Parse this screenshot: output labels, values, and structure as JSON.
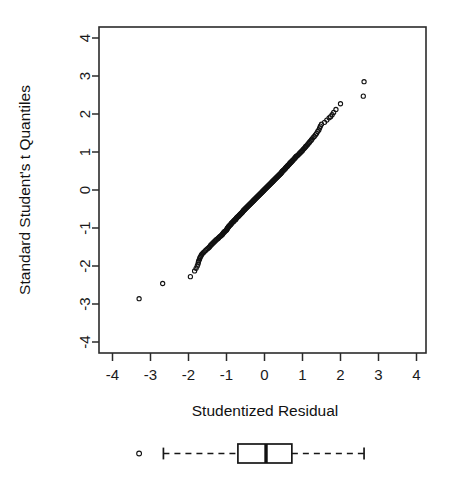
{
  "figure": {
    "background": "#ffffff",
    "foreground": "#1a1a1a"
  },
  "labels": {
    "y_axis_title": "Standard Student's t Quantiles",
    "x_axis_title": "Studentized Residual"
  },
  "chart_data": {
    "type": "scatter",
    "title": "",
    "subtitle": "",
    "xlabel": "Studentized Residual",
    "ylabel": "Standard Student's t Quantiles",
    "xlim": [
      -4.3,
      4.3
    ],
    "ylim": [
      -4.3,
      4.3
    ],
    "xticks": [
      "-4",
      "-3",
      "-2",
      "-1",
      "0",
      "1",
      "2",
      "3",
      "4"
    ],
    "xtick_values": [
      -4,
      -3,
      -2,
      -1,
      0,
      1,
      2,
      3,
      4
    ],
    "yticks": [
      "-4",
      "-3",
      "-2",
      "-1",
      "0",
      "1",
      "2",
      "3",
      "4"
    ],
    "ytick_values": [
      -4,
      -3,
      -2,
      -1,
      0,
      1,
      2,
      3,
      4
    ],
    "grid": false,
    "legend": "none",
    "marker": "open-circle",
    "marker_color": "#121212",
    "marker_radius": 2.1,
    "points": [
      [
        -3.3,
        -2.86
      ],
      [
        -2.68,
        -2.46
      ],
      [
        -1.95,
        -2.28
      ],
      [
        -1.84,
        -2.13
      ],
      [
        -1.8,
        -2.06
      ],
      [
        -1.77,
        -2.0
      ],
      [
        -1.75,
        -1.95
      ],
      [
        -1.74,
        -1.9
      ],
      [
        -1.73,
        -1.86
      ],
      [
        -1.71,
        -1.82
      ],
      [
        -1.7,
        -1.78
      ],
      [
        -1.68,
        -1.75
      ],
      [
        -1.66,
        -1.71
      ],
      [
        -1.64,
        -1.68
      ],
      [
        -1.61,
        -1.65
      ],
      [
        -1.58,
        -1.62
      ],
      [
        -1.55,
        -1.59
      ],
      [
        -1.52,
        -1.56
      ],
      [
        -1.49,
        -1.54
      ],
      [
        -1.46,
        -1.51
      ],
      [
        -1.44,
        -1.49
      ],
      [
        -1.42,
        -1.46
      ],
      [
        -1.4,
        -1.44
      ],
      [
        -1.38,
        -1.42
      ],
      [
        -1.36,
        -1.4
      ],
      [
        -1.34,
        -1.38
      ],
      [
        -1.32,
        -1.36
      ],
      [
        -1.3,
        -1.34
      ],
      [
        -1.28,
        -1.32
      ],
      [
        -1.26,
        -1.3
      ],
      [
        -1.23,
        -1.28
      ],
      [
        -1.21,
        -1.26
      ],
      [
        -1.19,
        -1.24
      ],
      [
        -1.17,
        -1.22
      ],
      [
        -1.15,
        -1.21
      ],
      [
        -1.13,
        -1.19
      ],
      [
        -1.11,
        -1.17
      ],
      [
        -1.1,
        -1.16
      ],
      [
        -1.09,
        -1.14
      ],
      [
        -1.08,
        -1.12
      ],
      [
        -1.06,
        -1.11
      ],
      [
        -1.05,
        -1.09
      ],
      [
        -1.03,
        -1.08
      ],
      [
        -1.01,
        -1.06
      ],
      [
        -1.0,
        -1.05
      ],
      [
        -0.99,
        -1.03
      ],
      [
        -0.98,
        -1.02
      ],
      [
        -0.97,
        -1.0
      ],
      [
        -0.96,
        -0.99
      ],
      [
        -0.95,
        -0.97
      ],
      [
        -0.94,
        -0.96
      ],
      [
        -0.93,
        -0.95
      ],
      [
        -0.92,
        -0.93
      ],
      [
        -0.9,
        -0.92
      ],
      [
        -0.89,
        -0.91
      ],
      [
        -0.88,
        -0.89
      ],
      [
        -0.87,
        -0.88
      ],
      [
        -0.86,
        -0.87
      ],
      [
        -0.85,
        -0.85
      ],
      [
        -0.83,
        -0.84
      ],
      [
        -0.82,
        -0.83
      ],
      [
        -0.81,
        -0.82
      ],
      [
        -0.8,
        -0.8
      ],
      [
        -0.78,
        -0.79
      ],
      [
        -0.77,
        -0.78
      ],
      [
        -0.76,
        -0.77
      ],
      [
        -0.75,
        -0.76
      ],
      [
        -0.74,
        -0.74
      ],
      [
        -0.73,
        -0.73
      ],
      [
        -0.72,
        -0.72
      ],
      [
        -0.71,
        -0.71
      ],
      [
        -0.7,
        -0.7
      ],
      [
        -0.68,
        -0.69
      ],
      [
        -0.67,
        -0.67
      ],
      [
        -0.66,
        -0.66
      ],
      [
        -0.65,
        -0.65
      ],
      [
        -0.64,
        -0.64
      ],
      [
        -0.63,
        -0.63
      ],
      [
        -0.62,
        -0.62
      ],
      [
        -0.61,
        -0.61
      ],
      [
        -0.6,
        -0.6
      ],
      [
        -0.59,
        -0.59
      ],
      [
        -0.58,
        -0.58
      ],
      [
        -0.57,
        -0.56
      ],
      [
        -0.56,
        -0.55
      ],
      [
        -0.55,
        -0.54
      ],
      [
        -0.54,
        -0.53
      ],
      [
        -0.53,
        -0.52
      ],
      [
        -0.52,
        -0.51
      ],
      [
        -0.51,
        -0.5
      ],
      [
        -0.5,
        -0.49
      ],
      [
        -0.49,
        -0.48
      ],
      [
        -0.48,
        -0.47
      ],
      [
        -0.47,
        -0.46
      ],
      [
        -0.46,
        -0.45
      ],
      [
        -0.45,
        -0.44
      ],
      [
        -0.44,
        -0.43
      ],
      [
        -0.43,
        -0.42
      ],
      [
        -0.42,
        -0.41
      ],
      [
        -0.41,
        -0.4
      ],
      [
        -0.4,
        -0.39
      ],
      [
        -0.39,
        -0.38
      ],
      [
        -0.38,
        -0.37
      ],
      [
        -0.37,
        -0.36
      ],
      [
        -0.36,
        -0.35
      ],
      [
        -0.35,
        -0.34
      ],
      [
        -0.34,
        -0.33
      ],
      [
        -0.33,
        -0.32
      ],
      [
        -0.32,
        -0.31
      ],
      [
        -0.31,
        -0.3
      ],
      [
        -0.3,
        -0.29
      ],
      [
        -0.29,
        -0.28
      ],
      [
        -0.28,
        -0.27
      ],
      [
        -0.27,
        -0.26
      ],
      [
        -0.26,
        -0.25
      ],
      [
        -0.25,
        -0.24
      ],
      [
        -0.24,
        -0.23
      ],
      [
        -0.23,
        -0.22
      ],
      [
        -0.22,
        -0.21
      ],
      [
        -0.21,
        -0.2
      ],
      [
        -0.2,
        -0.19
      ],
      [
        -0.19,
        -0.18
      ],
      [
        -0.18,
        -0.17
      ],
      [
        -0.17,
        -0.16
      ],
      [
        -0.16,
        -0.15
      ],
      [
        -0.15,
        -0.14
      ],
      [
        -0.14,
        -0.13
      ],
      [
        -0.13,
        -0.12
      ],
      [
        -0.12,
        -0.11
      ],
      [
        -0.11,
        -0.1
      ],
      [
        -0.1,
        -0.09
      ],
      [
        -0.09,
        -0.08
      ],
      [
        -0.08,
        -0.07
      ],
      [
        -0.07,
        -0.06
      ],
      [
        -0.06,
        -0.05
      ],
      [
        -0.05,
        -0.04
      ],
      [
        -0.04,
        -0.03
      ],
      [
        -0.03,
        -0.02
      ],
      [
        -0.02,
        -0.01
      ],
      [
        -0.01,
        0.0
      ],
      [
        0.0,
        0.01
      ],
      [
        0.01,
        0.02
      ],
      [
        0.02,
        0.03
      ],
      [
        0.03,
        0.04
      ],
      [
        0.04,
        0.05
      ],
      [
        0.05,
        0.06
      ],
      [
        0.06,
        0.07
      ],
      [
        0.07,
        0.08
      ],
      [
        0.08,
        0.09
      ],
      [
        0.09,
        0.1
      ],
      [
        0.1,
        0.11
      ],
      [
        0.11,
        0.12
      ],
      [
        0.12,
        0.13
      ],
      [
        0.13,
        0.14
      ],
      [
        0.14,
        0.15
      ],
      [
        0.15,
        0.16
      ],
      [
        0.16,
        0.17
      ],
      [
        0.17,
        0.18
      ],
      [
        0.18,
        0.19
      ],
      [
        0.19,
        0.2
      ],
      [
        0.2,
        0.21
      ],
      [
        0.21,
        0.22
      ],
      [
        0.22,
        0.23
      ],
      [
        0.23,
        0.24
      ],
      [
        0.24,
        0.25
      ],
      [
        0.25,
        0.26
      ],
      [
        0.26,
        0.27
      ],
      [
        0.27,
        0.28
      ],
      [
        0.28,
        0.29
      ],
      [
        0.29,
        0.3
      ],
      [
        0.3,
        0.31
      ],
      [
        0.31,
        0.32
      ],
      [
        0.32,
        0.33
      ],
      [
        0.33,
        0.34
      ],
      [
        0.34,
        0.35
      ],
      [
        0.35,
        0.36
      ],
      [
        0.36,
        0.37
      ],
      [
        0.37,
        0.38
      ],
      [
        0.38,
        0.39
      ],
      [
        0.39,
        0.4
      ],
      [
        0.4,
        0.41
      ],
      [
        0.41,
        0.42
      ],
      [
        0.42,
        0.43
      ],
      [
        0.43,
        0.44
      ],
      [
        0.44,
        0.45
      ],
      [
        0.45,
        0.46
      ],
      [
        0.46,
        0.48
      ],
      [
        0.47,
        0.49
      ],
      [
        0.48,
        0.5
      ],
      [
        0.49,
        0.51
      ],
      [
        0.5,
        0.52
      ],
      [
        0.52,
        0.53
      ],
      [
        0.53,
        0.55
      ],
      [
        0.54,
        0.56
      ],
      [
        0.55,
        0.57
      ],
      [
        0.56,
        0.58
      ],
      [
        0.57,
        0.6
      ],
      [
        0.58,
        0.61
      ],
      [
        0.6,
        0.62
      ],
      [
        0.61,
        0.64
      ],
      [
        0.62,
        0.65
      ],
      [
        0.63,
        0.66
      ],
      [
        0.65,
        0.68
      ],
      [
        0.66,
        0.69
      ],
      [
        0.67,
        0.71
      ],
      [
        0.69,
        0.72
      ],
      [
        0.7,
        0.74
      ],
      [
        0.72,
        0.75
      ],
      [
        0.73,
        0.77
      ],
      [
        0.75,
        0.78
      ],
      [
        0.76,
        0.8
      ],
      [
        0.78,
        0.82
      ],
      [
        0.79,
        0.83
      ],
      [
        0.81,
        0.85
      ],
      [
        0.82,
        0.87
      ],
      [
        0.84,
        0.89
      ],
      [
        0.86,
        0.9
      ],
      [
        0.88,
        0.92
      ],
      [
        0.9,
        0.94
      ],
      [
        0.92,
        0.96
      ],
      [
        0.94,
        0.98
      ],
      [
        0.96,
        1.0
      ],
      [
        0.98,
        1.02
      ],
      [
        1.0,
        1.04
      ],
      [
        1.02,
        1.07
      ],
      [
        1.04,
        1.09
      ],
      [
        1.06,
        1.11
      ],
      [
        1.08,
        1.14
      ],
      [
        1.1,
        1.16
      ],
      [
        1.13,
        1.19
      ],
      [
        1.15,
        1.22
      ],
      [
        1.18,
        1.25
      ],
      [
        1.2,
        1.28
      ],
      [
        1.23,
        1.31
      ],
      [
        1.25,
        1.34
      ],
      [
        1.28,
        1.38
      ],
      [
        1.31,
        1.41
      ],
      [
        1.34,
        1.45
      ],
      [
        1.37,
        1.49
      ],
      [
        1.4,
        1.54
      ],
      [
        1.43,
        1.58
      ],
      [
        1.45,
        1.63
      ],
      [
        1.47,
        1.68
      ],
      [
        1.5,
        1.73
      ],
      [
        1.58,
        1.78
      ],
      [
        1.64,
        1.84
      ],
      [
        1.7,
        1.9
      ],
      [
        1.74,
        1.93
      ],
      [
        1.78,
        1.98
      ],
      [
        1.82,
        2.04
      ],
      [
        1.88,
        2.12
      ],
      [
        2.0,
        2.27
      ],
      [
        2.6,
        2.47
      ],
      [
        2.62,
        2.85
      ]
    ],
    "outliers_low": [
      [
        -3.3,
        -2.86
      ],
      [
        -2.68,
        -2.46
      ],
      [
        -1.95,
        -2.28
      ]
    ],
    "outliers_high": [
      [
        2.6,
        2.47
      ],
      [
        2.62,
        2.85
      ]
    ]
  },
  "boxplot": {
    "orientation": "horizontal",
    "min_whisker": -2.66,
    "q1": -0.7,
    "median": 0.04,
    "q3": 0.72,
    "max_whisker": 2.62,
    "outliers": [
      -3.3
    ],
    "box_fill": "#ffffff",
    "line_color": "#171717",
    "whisker_style": "dashed"
  }
}
